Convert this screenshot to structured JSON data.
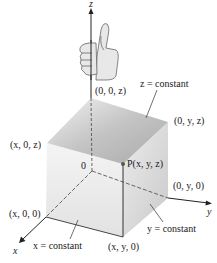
{
  "figure": {
    "axes": {
      "x_label": "x",
      "y_label": "y",
      "z_label": "z",
      "origin_label": "0"
    },
    "points": {
      "P": "P(x, y, z)",
      "z_axis_point": "(0, 0, z)",
      "yz_top": "(0, y, z)",
      "xz_top": "(x, 0, z)",
      "y_axis_point": "(0, y, 0)",
      "x_axis_point": "(x, 0, 0)",
      "xy_bottom": "(x, y, 0)"
    },
    "planes": {
      "z_plane": "z = constant",
      "x_plane": "x = constant",
      "y_plane": "y = constant"
    },
    "icon": "right-hand-thumbs-up",
    "colors": {
      "top_face": "#bdbdbd",
      "left_face": "#ececec",
      "right_face": "#dcdcdc",
      "axis": "#222222"
    }
  }
}
